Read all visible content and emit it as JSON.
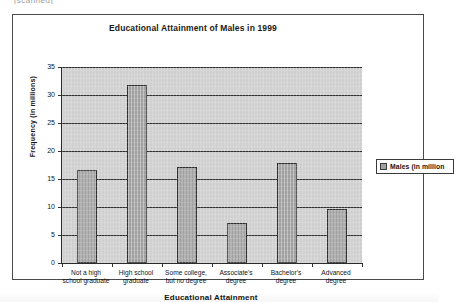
{
  "clipped_top_text": "[scanned]",
  "chart_data": {
    "type": "bar",
    "title": "Educational Attainment of Males in 1999",
    "xlabel": "Educational Attainment",
    "ylabel": "Frequency (in millions)",
    "categories": [
      "Not a high school graduate",
      "High school graduate",
      "Some college, but no degree",
      "Associate's degree",
      "Bachelor's degree",
      "Advanced degree"
    ],
    "category_lines": [
      [
        "Not a high",
        "school graduate"
      ],
      [
        "High school",
        "graduate"
      ],
      [
        "Some college,",
        "but no degree"
      ],
      [
        "Associate's",
        "degree"
      ],
      [
        "Bachelor's",
        "degree"
      ],
      [
        "Advanced",
        "degree"
      ]
    ],
    "values": [
      16.6,
      31.8,
      17.1,
      7.1,
      17.9,
      9.6
    ],
    "ylim": [
      0,
      35
    ],
    "ytick_labels": [
      "0",
      "5",
      "10",
      "15",
      "20",
      "25",
      "30",
      "35"
    ],
    "ytick_values": [
      0,
      5,
      10,
      15,
      20,
      25,
      30,
      35
    ],
    "grid": true,
    "legend_position": "right",
    "legend": [
      {
        "label": "Males (in million",
        "color": "#a0a0a0"
      }
    ],
    "series": [
      {
        "name": "Males (in million",
        "values": [
          16.6,
          31.8,
          17.1,
          7.1,
          17.9,
          9.6
        ]
      }
    ]
  },
  "colors": {
    "bar_fill": "#a0a0a0",
    "bar_stroke": "#2b2b2b",
    "plot_background": "#cfcfcf",
    "gridline": "#2f2f2f",
    "frame": "#4a4a4a",
    "text": "#141414"
  }
}
